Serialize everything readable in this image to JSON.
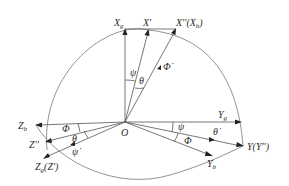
{
  "diagram": {
    "type": "coordinate-frame-rotation",
    "origin_label": "O",
    "axes": {
      "Xg": {
        "label": "X",
        "sub": "g"
      },
      "X1": {
        "label": "X'"
      },
      "X2": {
        "label": "X''(X",
        "sub": "b",
        "suffix": ")"
      },
      "Yg": {
        "label": "Y",
        "sub": "g"
      },
      "Y2": {
        "label": "Y(Y'')"
      },
      "Yb": {
        "label": "Y",
        "sub": "b"
      },
      "Zb": {
        "label": "Z",
        "sub": "b"
      },
      "Z2": {
        "label": "Z''"
      },
      "Zg": {
        "label": "Z",
        "sub": "g",
        "suffix": "(Z')"
      }
    },
    "angles": {
      "psi_top": "ψ",
      "theta_top": "θ",
      "phi_dot": "Φ̇",
      "phi_left": "Φ",
      "theta_left": "θ",
      "psi_dot": "ψ̇",
      "psi_right": "ψ",
      "theta_dot": "θ̇",
      "phi_right": "Φ"
    },
    "colors": {
      "line": "#555555",
      "arc": "#777777",
      "text": "#2a2a2a",
      "arrow": "#222222"
    }
  }
}
